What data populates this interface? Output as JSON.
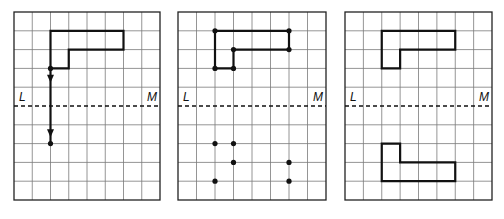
{
  "figure": {
    "grid": {
      "columns": 8,
      "rows": 10,
      "mirror_row_line": 5
    },
    "line_labels": {
      "left": "L",
      "right": "M"
    },
    "colors": {
      "ink": "#111111",
      "grid": "#7a7a7a",
      "background": "#ffffff"
    },
    "original_shape_vertices": [
      [
        2,
        1
      ],
      [
        6,
        1
      ],
      [
        6,
        2
      ],
      [
        3,
        2
      ],
      [
        3,
        3
      ],
      [
        2,
        3
      ]
    ],
    "panels": [
      {
        "id": "panel-1",
        "x": 14,
        "y": 12,
        "w": 146,
        "h": 188,
        "show_shape": true,
        "shape_dots": false,
        "track": {
          "from": [
            2,
            3
          ],
          "to": [
            2,
            7
          ],
          "arrows_at_rows": [
            3.55,
            6.45
          ]
        },
        "reflected_dots": [
          [
            2,
            7
          ]
        ],
        "show_reflected_shape": false
      },
      {
        "id": "panel-2",
        "x": 178,
        "y": 12,
        "w": 148,
        "h": 188,
        "show_shape": true,
        "shape_dots": true,
        "track": null,
        "reflected_dots": [
          [
            2,
            7
          ],
          [
            3,
            7
          ],
          [
            3,
            8
          ],
          [
            6,
            8
          ],
          [
            2,
            9
          ],
          [
            6,
            9
          ]
        ],
        "show_reflected_shape": false
      },
      {
        "id": "panel-3",
        "x": 345,
        "y": 12,
        "w": 147,
        "h": 188,
        "show_shape": true,
        "shape_dots": false,
        "track": null,
        "reflected_dots": [],
        "show_reflected_shape": true
      }
    ]
  }
}
